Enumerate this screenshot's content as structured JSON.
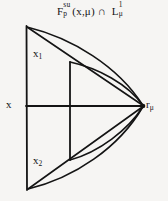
{
  "figure": {
    "kind": "mathematical-diagram",
    "background_color": "#f6f5f3",
    "ink_color": "#141414",
    "title": {
      "base": "F",
      "superscript": "su",
      "subscript": "p",
      "argument": "(x,μ)",
      "operator": "∩",
      "second_base": "L",
      "second_superscript": "1",
      "second_subscript": "μ",
      "full_text": "F_p^su(x,μ) ∩ L_μ^1"
    },
    "labels": {
      "left_point": "x",
      "upper_point_base": "x",
      "upper_point_sub": "1",
      "lower_point_base": "x",
      "lower_point_sub": "2",
      "right_point_base": "r",
      "right_point_sub": "μ"
    },
    "geometry": {
      "left_vertical_segment": {
        "x": 26,
        "y_top": 26,
        "y_bottom": 190
      },
      "middle_vertical_segment": {
        "x": 70,
        "y_top": 62,
        "y_bottom": 160
      },
      "horizontal_axis": {
        "y": 106,
        "x_left": 26,
        "x_right": 143
      },
      "right_vertex": {
        "x": 143,
        "y": 106
      },
      "top_vertex": {
        "x": 26,
        "y": 26
      },
      "bottom_vertex": {
        "x": 27,
        "y": 190
      },
      "upper_node": {
        "x": 70,
        "y": 62
      },
      "lower_node": {
        "x": 70,
        "y": 160
      },
      "upper_curve_count": 3,
      "lower_curve_count": 3
    }
  }
}
